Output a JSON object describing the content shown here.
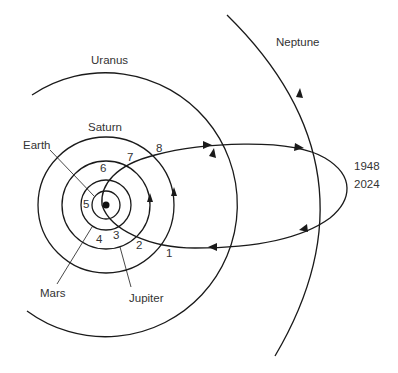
{
  "diagram": {
    "planets": [
      {
        "name": "Earth",
        "label": "Earth"
      },
      {
        "name": "Mars",
        "label": "Mars"
      },
      {
        "name": "Jupiter",
        "label": "Jupiter"
      },
      {
        "name": "Saturn",
        "label": "Saturn"
      },
      {
        "name": "Uranus",
        "label": "Uranus"
      },
      {
        "name": "Neptune",
        "label": "Neptune"
      }
    ],
    "comet_positions": [
      "1",
      "2",
      "3",
      "4",
      "5",
      "6",
      "7",
      "8"
    ],
    "aphelion_years": [
      "1948",
      "2024"
    ],
    "colors": {
      "line": "#1a1a1a",
      "text": "#333333",
      "background": "#ffffff"
    }
  }
}
